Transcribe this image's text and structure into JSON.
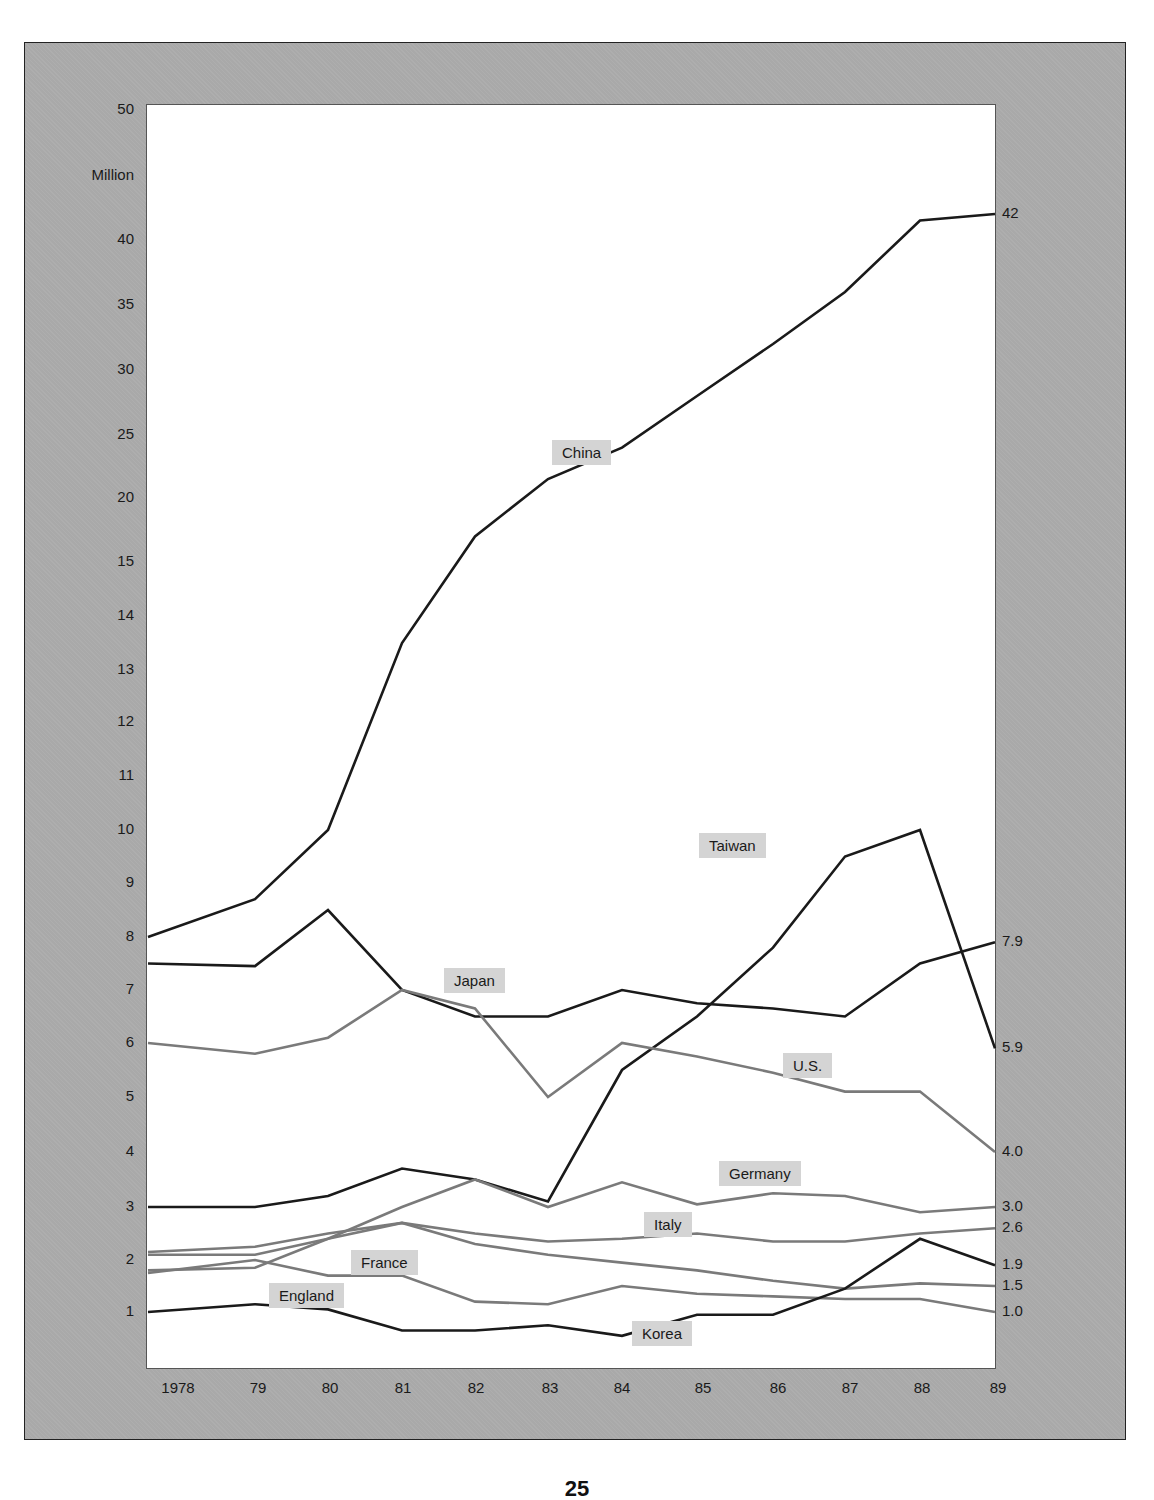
{
  "chart_data": {
    "type": "line",
    "title": "",
    "ylabel": "Million",
    "xlabel": "",
    "ylim": [
      0,
      50
    ],
    "y_scale_note": "broken/non-linear axis: 1-15 in steps of 1, then 15-50 in steps of 5",
    "y_ticks": [
      "50",
      "40",
      "35",
      "30",
      "25",
      "20",
      "15",
      "14",
      "13",
      "12",
      "11",
      "10",
      "9",
      "8",
      "7",
      "6",
      "5",
      "4",
      "3",
      "2",
      "1"
    ],
    "categories": [
      "1978",
      "79",
      "80",
      "81",
      "82",
      "83",
      "84",
      "85",
      "86",
      "87",
      "88",
      "89"
    ],
    "grid": false,
    "legend": "inline labels",
    "series": [
      {
        "name": "China",
        "color": "#1a1a1a",
        "values": [
          8.0,
          8.7,
          10.0,
          13.5,
          17.0,
          21.5,
          24.0,
          28.0,
          32.0,
          36.0,
          41.5,
          42.0
        ],
        "end_label": "42"
      },
      {
        "name": "Taiwan",
        "color": "#1a1a1a",
        "values": [
          3.0,
          3.0,
          3.2,
          3.7,
          3.5,
          3.1,
          5.5,
          6.5,
          7.8,
          9.5,
          10.0,
          6.5
        ],
        "end_label": "5.9",
        "last_value": 5.9
      },
      {
        "name": "Japan",
        "color": "#1a1a1a",
        "values": [
          7.5,
          7.45,
          8.5,
          7.0,
          6.5,
          6.5,
          7.0,
          6.75,
          6.65,
          6.5,
          7.5,
          7.9
        ],
        "end_label": "7.9"
      },
      {
        "name": "U.S.",
        "color": "#7a7a7a",
        "values": [
          6.0,
          5.8,
          6.1,
          7.0,
          6.65,
          5.0,
          6.0,
          5.75,
          5.45,
          5.1,
          5.1,
          4.0
        ],
        "end_label": "4.0"
      },
      {
        "name": "Germany",
        "color": "#7a7a7a",
        "values": [
          1.8,
          1.85,
          2.4,
          3.0,
          3.5,
          3.0,
          3.45,
          3.05,
          3.25,
          3.2,
          2.9,
          3.0
        ],
        "end_label": "3.0"
      },
      {
        "name": "Italy",
        "color": "#7a7a7a",
        "values": [
          2.15,
          2.25,
          2.5,
          2.7,
          2.5,
          2.35,
          2.4,
          2.5,
          2.35,
          2.35,
          2.5,
          2.6
        ],
        "end_label": "2.6"
      },
      {
        "name": "France",
        "color": "#7a7a7a",
        "values": [
          2.1,
          2.1,
          2.4,
          2.7,
          2.3,
          2.1,
          1.95,
          1.8,
          1.6,
          1.45,
          1.55,
          1.5
        ],
        "end_label": "1.5"
      },
      {
        "name": "England",
        "color": "#7a7a7a",
        "values": [
          1.75,
          2.0,
          1.7,
          1.7,
          1.2,
          1.15,
          1.5,
          1.35,
          1.3,
          1.25,
          1.25,
          1.0
        ],
        "end_label": "1.0"
      },
      {
        "name": "Korea",
        "color": "#1a1a1a",
        "values": [
          1.0,
          1.15,
          1.05,
          0.65,
          0.65,
          0.75,
          0.55,
          0.95,
          0.95,
          1.45,
          2.4,
          3.0
        ],
        "end_label": "1.9",
        "last_value": 1.9
      }
    ]
  },
  "labels": {
    "y_unit": "Million",
    "page_number": "25"
  },
  "inline_labels": [
    {
      "name": "China",
      "x": 552,
      "y": 440
    },
    {
      "name": "Taiwan",
      "x": 699,
      "y": 833
    },
    {
      "name": "Japan",
      "x": 444,
      "y": 968
    },
    {
      "name": "U.S.",
      "x": 783,
      "y": 1053
    },
    {
      "name": "Germany",
      "x": 719,
      "y": 1161
    },
    {
      "name": "Italy",
      "x": 644,
      "y": 1212
    },
    {
      "name": "France",
      "x": 351,
      "y": 1250
    },
    {
      "name": "England",
      "x": 269,
      "y": 1283
    },
    {
      "name": "Korea",
      "x": 632,
      "y": 1321
    }
  ]
}
